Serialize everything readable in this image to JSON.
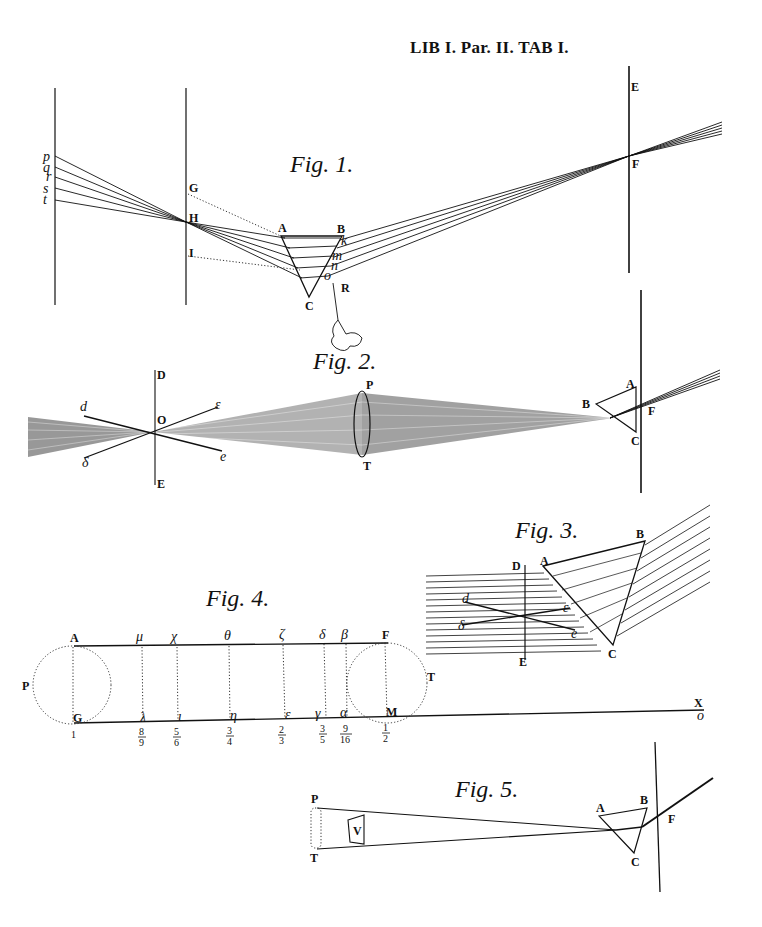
{
  "plate": {
    "header": "LIB I. Par. II. TAB I.",
    "background": "#ffffff",
    "ink": "#111111"
  },
  "figures": [
    {
      "id": "fig1",
      "title": "Fig. 1.",
      "labels": {
        "ray_points": [
          "p",
          "q",
          "r",
          "s",
          "t"
        ],
        "screen_left": [
          "G",
          "H",
          "I"
        ],
        "prism": [
          "A",
          "B",
          "C"
        ],
        "exit_points": [
          "k",
          "m",
          "n",
          "o"
        ],
        "hand": "R",
        "screen_right": [
          "E",
          "F"
        ]
      }
    },
    {
      "id": "fig2",
      "title": "Fig. 2.",
      "labels": {
        "screen": [
          "D",
          "O",
          "E"
        ],
        "lines": [
          "d",
          "ε",
          "δ",
          "e"
        ],
        "lens": [
          "P",
          "T"
        ],
        "prism": [
          "A",
          "B",
          "C"
        ],
        "focus": "F"
      }
    },
    {
      "id": "fig3",
      "title": "Fig. 3.",
      "labels": {
        "screen": [
          "D",
          "E"
        ],
        "lines": [
          "d",
          "δ",
          "ε",
          "e"
        ],
        "prism": [
          "A",
          "B",
          "C"
        ]
      }
    },
    {
      "id": "fig4",
      "title": "Fig. 4.",
      "labels": {
        "top": [
          "A",
          "μ",
          "χ",
          "θ",
          "ζ",
          "δ",
          "β",
          "F"
        ],
        "bottom": [
          "G",
          "λ",
          "ι",
          "η",
          "ε",
          "γ",
          "α",
          "M"
        ],
        "circles": [
          "P",
          "T"
        ],
        "axis_end": [
          "X",
          "o"
        ],
        "fractions": [
          {
            "num": "",
            "den": "",
            "whole": "1"
          },
          {
            "num": "8",
            "den": "9"
          },
          {
            "num": "5",
            "den": "6"
          },
          {
            "num": "3",
            "den": "4"
          },
          {
            "num": "2",
            "den": "3"
          },
          {
            "num": "3",
            "den": "5"
          },
          {
            "num": "9",
            "den": "16"
          },
          {
            "num": "1",
            "den": "2"
          }
        ]
      }
    },
    {
      "id": "fig5",
      "title": "Fig. 5.",
      "labels": {
        "object": [
          "P",
          "T"
        ],
        "plate": "V",
        "prism": [
          "A",
          "B",
          "C"
        ],
        "focus": "F"
      }
    }
  ]
}
